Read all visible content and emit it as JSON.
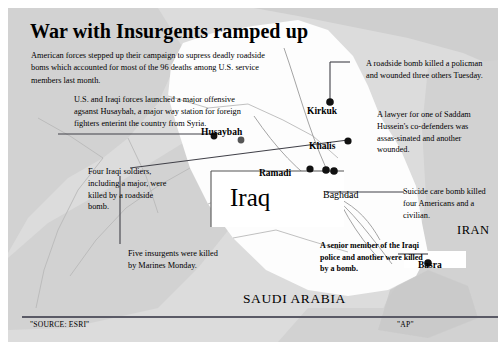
{
  "headline": "War with Insurgents ramped up",
  "lede": "American forces stepped up their campaign to supress deadly roadside boms which accounted for most of the 96 deaths among U.S. service members last month.",
  "annotations": {
    "husaybah": "U.S. and Iraqi forces launched a major offensive agsanst Husaybah, a major way station for foreign fighters enterint the country from Syria.",
    "four_iraqi": "Four Iraqi soldiers, including a major, were killed by a roadside bomb.",
    "five_insurgents": "Five insurgents were killed by Marines Monday.",
    "roadside_bomb": "A roadside bomb killed a policman and wounded three others Tuesday.",
    "lawyer": "A lawyer for one of Saddam Hussein's co-defenders was assas-sinated and another wounded.",
    "suicide": "Suicide care bomb killed four Americans and a civilian.",
    "senior_police": "A senior member of the Iraqi police and another were killed by a bomb."
  },
  "cities": [
    {
      "name": "Husaybah"
    },
    {
      "name": "Kirkuk"
    },
    {
      "name": "Khalis"
    },
    {
      "name": "Ramadi"
    },
    {
      "name": "Baghdad"
    },
    {
      "name": "Basra"
    }
  ],
  "countries": {
    "iraq": "Iraq",
    "iran": "IRAN",
    "saudi": "SAUDI ARABIA"
  },
  "footer": {
    "source": "\"SOURCE: ESRI\"",
    "credit": "\"AP\""
  },
  "colors": {
    "panel_bg": "#dcdcdc",
    "iraq_fill": "#fdfdfd",
    "neighbor_fill": "#d2d2d2",
    "border_line": "#b4b4b4",
    "leader_line": "#404048",
    "footer_rule": "#5a5a66",
    "dot": "#111111"
  }
}
